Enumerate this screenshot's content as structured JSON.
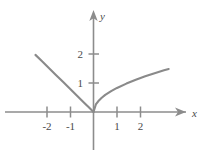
{
  "figure": {
    "background_color": "#ffffff",
    "axis_color": "#8c8c8c",
    "curve_color": "#8a8a8a",
    "label_color": "#4a4a4a",
    "x_axis_label": "x",
    "y_axis_label": "y"
  },
  "chart_data": {
    "type": "line",
    "title": "",
    "subtitle": "",
    "xlabel": "x",
    "ylabel": "y",
    "xlim": [
      -3.75,
      5.45
    ],
    "ylim": [
      -1.3,
      3.55
    ],
    "xticks": [
      -2,
      -1,
      1,
      2
    ],
    "xtick_labels": [
      "-2",
      "-1",
      "1",
      "2"
    ],
    "yticks": [
      1,
      2
    ],
    "ytick_labels": [
      "1",
      "2"
    ],
    "grid": false,
    "legend": null,
    "annotations": [],
    "series": [
      {
        "name": "left-branch",
        "description": "straight line segment from upper left down to the origin",
        "x": [
          -2.47,
          -2.2,
          -1.9,
          -1.6,
          -1.3,
          -1.0,
          -0.7,
          -0.4,
          -0.2,
          0
        ],
        "y": [
          1.97,
          1.76,
          1.52,
          1.28,
          1.04,
          0.8,
          0.56,
          0.32,
          0.16,
          0
        ]
      },
      {
        "name": "right-branch",
        "description": "square-root shaped curve rising from the origin to the right",
        "x": [
          0,
          0.1,
          0.2,
          0.35,
          0.5,
          0.75,
          1.0,
          1.4,
          1.8,
          2.2,
          2.6,
          3.0,
          3.2
        ],
        "y": [
          0,
          0.26,
          0.37,
          0.49,
          0.59,
          0.72,
          0.83,
          0.98,
          1.11,
          1.23,
          1.34,
          1.44,
          1.48
        ]
      }
    ]
  }
}
